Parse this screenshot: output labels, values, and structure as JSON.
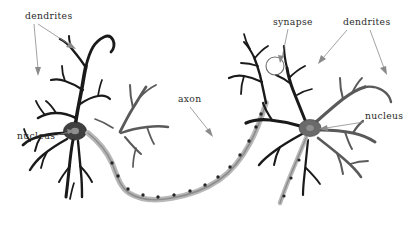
{
  "figure": {
    "background_color": "#ffffff",
    "width": 412,
    "height": 228,
    "style": "grayscale line drawing"
  },
  "labels": {
    "dendrites_left": "dendrites",
    "dendrites_right": "dendrites",
    "nucleus_left": "nucleus",
    "nucleus_right": "nucleus",
    "axon": "axon",
    "synapse": "synapse"
  },
  "colors": {
    "ink_dark": "#1a1a1a",
    "ink_mid": "#5a5a5a",
    "axon_sheath": "#b8b8b8",
    "label_text": "#2b2b2b",
    "pointer": "#8a8a8a",
    "background": "#ffffff"
  },
  "structures": [
    {
      "name": "neuron-left",
      "soma_x": 75,
      "soma_y": 131,
      "label_nucleus": "nucleus",
      "label_dendrites": "dendrites"
    },
    {
      "name": "neuron-right",
      "soma_x": 310,
      "soma_y": 128,
      "label_nucleus": "nucleus",
      "label_dendrites": "dendrites"
    },
    {
      "name": "axon",
      "label": "axon",
      "description": "myelinated axon with nodes of Ranvier connecting left neuron to right neuron"
    },
    {
      "name": "synapse",
      "label": "synapse",
      "circle_x": 275,
      "circle_y": 66,
      "circle_r": 9
    }
  ]
}
